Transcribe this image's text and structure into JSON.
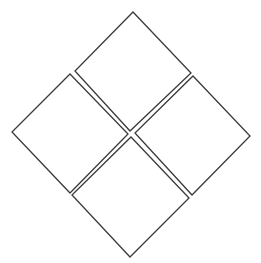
{
  "diagram": {
    "stroke_color": "#3a3a3a",
    "fill_color": "#ffffff",
    "tiles": [
      {
        "name": "top",
        "points": "133,12 191,73 130,131 75,71"
      },
      {
        "name": "left",
        "points": "70,74 128,134 70,193 12,132"
      },
      {
        "name": "right",
        "points": "193,76 250,136 192,195 135,133"
      },
      {
        "name": "bottom",
        "points": "131,137 189,198 130,257 72,195"
      }
    ]
  }
}
